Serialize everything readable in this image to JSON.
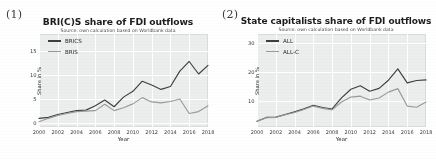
{
  "figure": {
    "background": "#ffffff",
    "panels": [
      {
        "label": "(1)",
        "name": "panel-1"
      },
      {
        "label": "(2)",
        "name": "panel-2"
      }
    ]
  },
  "chart_data": [
    {
      "type": "line",
      "title": "BRI(C)S share of FDI outflows",
      "subtitle": "Source: own calculation based on Worldbank data",
      "xlabel": "Year",
      "ylabel": "Share in %",
      "grid": true,
      "legend_position": "upper left",
      "xlim": [
        2000,
        2018
      ],
      "ylim": [
        -0.8,
        18.5
      ],
      "yticks": [
        0,
        5,
        10,
        15
      ],
      "xticks": [
        2000,
        2002,
        2004,
        2006,
        2008,
        2010,
        2012,
        2014,
        2016,
        2018
      ],
      "x": [
        2000,
        2001,
        2002,
        2003,
        2004,
        2005,
        2006,
        2007,
        2008,
        2009,
        2010,
        2011,
        2012,
        2013,
        2014,
        2015,
        2016,
        2017,
        2018
      ],
      "series": [
        {
          "name": "BRICS",
          "color": "#3f3f3f",
          "values": [
            1.0,
            1.2,
            1.8,
            2.2,
            2.6,
            2.7,
            3.6,
            4.8,
            3.4,
            5.4,
            6.6,
            8.7,
            7.9,
            7.0,
            7.6,
            10.8,
            12.8,
            10.2,
            12.0,
            17.5
          ]
        },
        {
          "name": "BRIS",
          "color": "#9a9a9a",
          "values": [
            0.3,
            1.0,
            1.6,
            2.0,
            2.4,
            2.5,
            2.6,
            3.9,
            2.6,
            3.2,
            4.0,
            5.3,
            4.4,
            4.2,
            4.5,
            5.0,
            2.0,
            2.4,
            3.6,
            7.0
          ]
        }
      ]
    },
    {
      "type": "line",
      "title": "State capitalists share of FDI outflows",
      "subtitle": "Source: own calculation based on Worldbank data",
      "xlabel": "Year",
      "ylabel": "Share in %",
      "grid": true,
      "legend_position": "upper left",
      "xlim": [
        2000,
        2018
      ],
      "ylim": [
        1.0,
        33.0
      ],
      "yticks": [
        10,
        20,
        30
      ],
      "xticks": [
        2000,
        2002,
        2004,
        2006,
        2008,
        2010,
        2012,
        2014,
        2016,
        2018
      ],
      "x": [
        2000,
        2001,
        2002,
        2003,
        2004,
        2005,
        2006,
        2007,
        2008,
        2009,
        2010,
        2011,
        2012,
        2013,
        2014,
        2015,
        2016,
        2017,
        2018
      ],
      "series": [
        {
          "name": "ALL",
          "color": "#3f3f3f",
          "values": [
            3.0,
            4.3,
            4.4,
            5.3,
            6.2,
            7.3,
            8.5,
            7.7,
            7.2,
            11.0,
            14.0,
            15.2,
            13.3,
            14.3,
            17.1,
            21.0,
            16.2,
            17.0,
            17.2,
            31.0
          ]
        },
        {
          "name": "ALL-C",
          "color": "#9a9a9a",
          "values": [
            3.0,
            4.2,
            4.3,
            5.2,
            6.0,
            7.0,
            8.2,
            7.4,
            6.9,
            9.6,
            11.3,
            11.6,
            10.3,
            11.0,
            13.0,
            14.2,
            8.2,
            7.8,
            9.6,
            20.0
          ]
        }
      ]
    }
  ]
}
